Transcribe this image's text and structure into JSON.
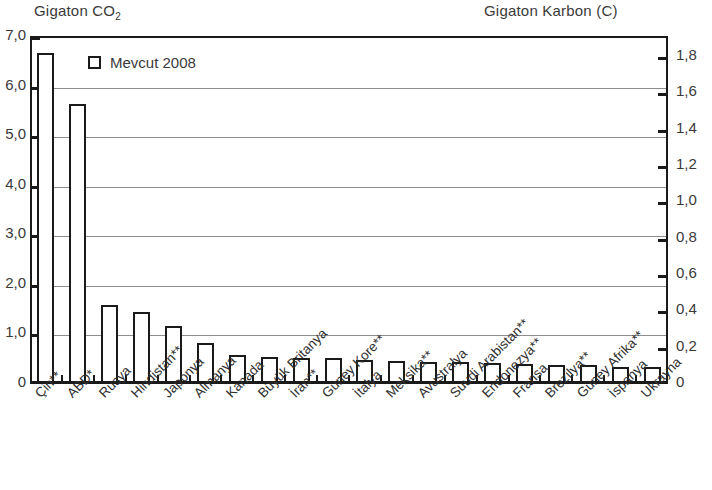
{
  "headers": {
    "left_axis_title": "Gigaton CO",
    "left_axis_title_sub": "2",
    "right_axis_title": "Gigaton Karbon (C)"
  },
  "legend": {
    "label": "Mevcut 2008",
    "marker": "open-square"
  },
  "axes": {
    "left_ticks": [
      "7,0",
      "6,0",
      "5,0",
      "4,0",
      "3,0",
      "2,0",
      "1,0",
      "0"
    ],
    "left_values": [
      7.0,
      6.0,
      5.0,
      4.0,
      3.0,
      2.0,
      1.0,
      0
    ],
    "right_ticks": [
      "1,8",
      "1,6",
      "1,4",
      "1,2",
      "1,0",
      "0,8",
      "0,6",
      "0,4",
      "0,2",
      "0"
    ],
    "right_values": [
      1.8,
      1.6,
      1.4,
      1.2,
      1.0,
      0.8,
      0.6,
      0.4,
      0.2,
      0
    ],
    "gridline_values_left": [
      6.0,
      5.0,
      4.0,
      3.0,
      2.0,
      1.0
    ],
    "ylim_left": [
      0,
      7.0
    ],
    "ylim_right": [
      0,
      1.9091
    ]
  },
  "chart_data": {
    "type": "bar",
    "title": "",
    "xlabel": "",
    "ylabel": "Gigaton CO2",
    "ylabel_right": "Gigaton Karbon (C)",
    "ylim": [
      0,
      7.0
    ],
    "ylim_secondary": [
      0,
      1.9091
    ],
    "grid": true,
    "legend_position": "top-left",
    "series_name": "Mevcut 2008",
    "categories": [
      "Çin**",
      "ABD*",
      "Rusya",
      "Hindistan**",
      "Japonya",
      "Almanya",
      "Kanada",
      "Büyük Britanya",
      "İran**",
      "Güney Kore**",
      "İtalya",
      "Meksika**",
      "Avustralya",
      "Suudi Arabistan**",
      "Endonezya**",
      "Fransa",
      "Brezilya**",
      "Güney Afrika**",
      "İspanya",
      "Ukrayna"
    ],
    "values": [
      6.65,
      5.62,
      1.58,
      1.43,
      1.15,
      0.8,
      0.57,
      0.53,
      0.5,
      0.5,
      0.47,
      0.45,
      0.43,
      0.42,
      0.4,
      0.38,
      0.37,
      0.36,
      0.33,
      0.32
    ],
    "units": "Gigaton CO2"
  }
}
